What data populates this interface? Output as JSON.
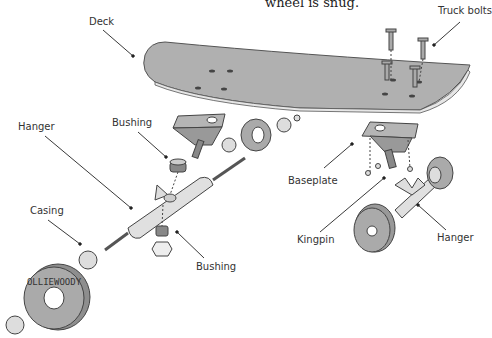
{
  "caption": "wheel is snug.",
  "labels": {
    "deck": "Deck",
    "truck_bolts": "Truck bolts",
    "hanger_left": "Hanger",
    "bushing_top": "Bushing",
    "casing": "Casing",
    "bushing_bottom": "Bushing",
    "baseplate": "Baseplate",
    "kingpin": "Kingpin",
    "hanger_right": "Hanger"
  },
  "wheel_text": "OLLIEWOODY",
  "colors": {
    "part_fill": "#b3b3b3",
    "part_dark": "#8e8e8e",
    "outline": "#444444",
    "light_fill": "#e6e6e6"
  }
}
